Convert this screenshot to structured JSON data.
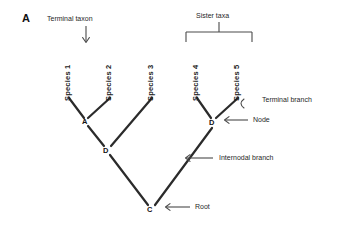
{
  "figure": {
    "panel_letter": "A",
    "background_color": "#ffffff",
    "line_color": "#2b2b2b",
    "annotation_color": "#1f1f1f"
  },
  "taxa": [
    {
      "label": "Species 1",
      "x": 72,
      "y": 92
    },
    {
      "label": "Species 2",
      "x": 113,
      "y": 92
    },
    {
      "label": "Species 3",
      "x": 155,
      "y": 92
    },
    {
      "label": "Species 4",
      "x": 200,
      "y": 92
    },
    {
      "label": "Species 5",
      "x": 241,
      "y": 92
    }
  ],
  "nodes": [
    {
      "label": "A",
      "x": 86,
      "y": 121
    },
    {
      "label": "D",
      "x": 107,
      "y": 150
    },
    {
      "label": "D",
      "x": 213,
      "y": 122
    },
    {
      "label": "C",
      "x": 151,
      "y": 209
    }
  ],
  "annotations": {
    "terminal_taxon": "Terminal taxon",
    "sister_taxa": "Sister taxa",
    "terminal_branch": "Terminal branch",
    "node": "Node",
    "internodal_branch": "Internodal branch",
    "root": "Root"
  },
  "icons": {
    "down_arrow": "down-arrow-icon",
    "left_arrow": "left-arrow-icon",
    "bracket": "bracket-icon",
    "curved_pointer": "curved-pointer-icon"
  }
}
